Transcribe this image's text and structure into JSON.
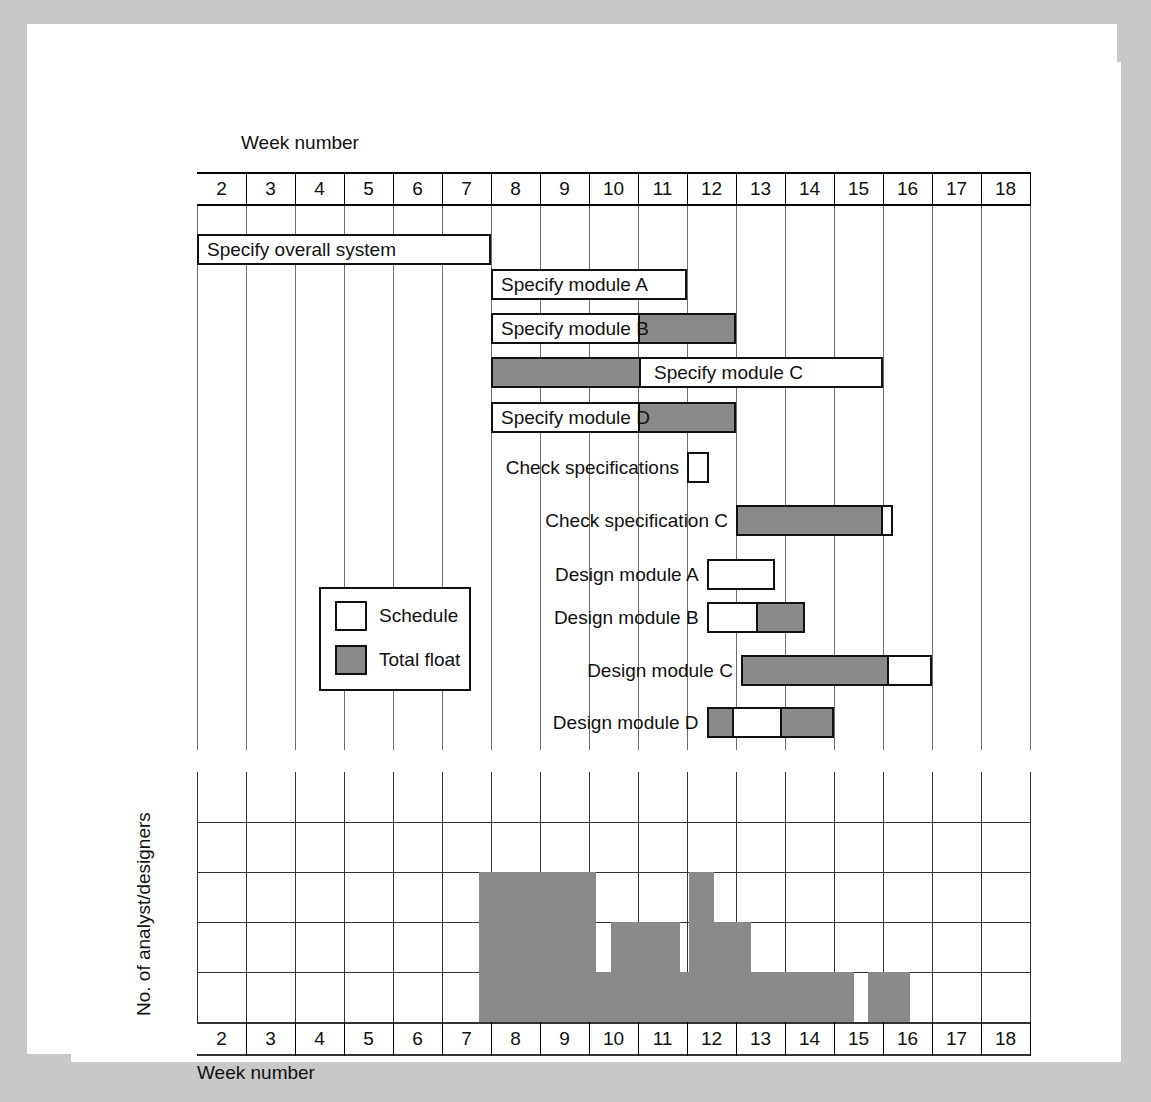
{
  "figure": {
    "top_axis_title": "Week number",
    "bottom_axis_title": "Week number",
    "y_axis_title": "No. of analyst/designers"
  },
  "weeks": [
    "2",
    "3",
    "4",
    "5",
    "6",
    "7",
    "8",
    "9",
    "10",
    "11",
    "12",
    "13",
    "14",
    "15",
    "16",
    "17",
    "18"
  ],
  "legend": {
    "items": [
      {
        "label": "Schedule",
        "swatch": "white",
        "color": "#ffffff"
      },
      {
        "label": "Total float",
        "swatch": "float",
        "color": "#8a8a8a"
      }
    ]
  },
  "colors": {
    "schedule_fill": "#ffffff",
    "float_fill": "#8a8a8a",
    "outline": "#111111",
    "grid": "#6e6e6e",
    "page_border": "#c8c8c8"
  },
  "chart_data": {
    "type": "bar",
    "xlabel": "Week number",
    "ylabel": "No. of analyst/designers",
    "xlim": [
      2,
      19
    ],
    "grid": true,
    "legend": [
      "Schedule",
      "Total float"
    ],
    "tasks": [
      {
        "name": "Specify overall system",
        "label_position": "inside",
        "schedule_start": 2,
        "schedule_end": 8,
        "float_start": null,
        "float_end": null
      },
      {
        "name": "Specify module A",
        "label_position": "inside",
        "schedule_start": 8,
        "schedule_end": 12,
        "float_start": null,
        "float_end": null
      },
      {
        "name": "Specify module B",
        "label_position": "inside",
        "schedule_start": 8,
        "schedule_end": 11,
        "float_start": 11,
        "float_end": 13
      },
      {
        "name": "Specify module C",
        "label_position": "inside-right",
        "schedule_start": 11,
        "schedule_end": 16,
        "float_start": 8,
        "float_end": 11
      },
      {
        "name": "Specify module D",
        "label_position": "inside",
        "schedule_start": 8,
        "schedule_end": 11,
        "float_start": 11,
        "float_end": 13
      },
      {
        "name": "Check specifications",
        "label_position": "left",
        "schedule_start": 12,
        "schedule_end": 12.45,
        "float_start": null,
        "float_end": null
      },
      {
        "name": "Check specification C",
        "label_position": "left",
        "schedule_start": 16,
        "schedule_end": 16.2,
        "float_start": 13,
        "float_end": 16
      },
      {
        "name": "Design module A",
        "label_position": "left",
        "schedule_start": 12.4,
        "schedule_end": 13.8,
        "float_start": null,
        "float_end": null
      },
      {
        "name": "Design module B",
        "label_position": "left",
        "schedule_start": 12.4,
        "schedule_end": 13.4,
        "float_start": 13.4,
        "float_end": 14.4
      },
      {
        "name": "Design module C",
        "label_position": "left",
        "schedule_start": 16.1,
        "schedule_end": 17.0,
        "float_start": 13.1,
        "float_end": 16.1
      },
      {
        "name": "Design module D",
        "label_position": "left",
        "schedule_start": 12.9,
        "schedule_end": 13.9,
        "float_start": 12.4,
        "float_end": 12.9,
        "float2_start": 13.9,
        "float2_end": 15.0
      }
    ],
    "histogram": {
      "ylim": [
        0,
        5
      ],
      "yticks": [
        0,
        1,
        2,
        3,
        4
      ],
      "steps": [
        {
          "start": 7.75,
          "end": 10.15,
          "value": 3
        },
        {
          "start": 10.15,
          "end": 10.45,
          "value": 1
        },
        {
          "start": 10.45,
          "end": 11.85,
          "value": 2
        },
        {
          "start": 11.85,
          "end": 12.05,
          "value": 1
        },
        {
          "start": 12.05,
          "end": 12.55,
          "value": 3
        },
        {
          "start": 12.55,
          "end": 13.3,
          "value": 2
        },
        {
          "start": 13.3,
          "end": 15.4,
          "value": 1
        },
        {
          "start": 15.4,
          "end": 15.7,
          "value": 0
        },
        {
          "start": 15.7,
          "end": 16.55,
          "value": 1
        }
      ]
    }
  }
}
